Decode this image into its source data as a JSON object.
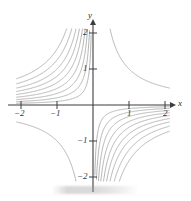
{
  "figure": {
    "title": "",
    "background_color": "#ffffff",
    "width": 191,
    "height": 201
  },
  "axes": {
    "x_axis_label": "x",
    "y_axis_label": "y",
    "axis_color": "#3d3d3d",
    "arrow_x_name": "x-axis-arrow",
    "arrow_y_name": "y-axis-arrow",
    "x_ticks": [
      {
        "value": -2,
        "label": "−2",
        "px": 21
      },
      {
        "value": -1,
        "label": "−1",
        "px": 57
      },
      {
        "value": 1,
        "label": "1",
        "px": 129
      },
      {
        "value": 2,
        "label": "2",
        "px": 165
      }
    ],
    "y_ticks": [
      {
        "value": 2,
        "label": "2",
        "px": 33
      },
      {
        "value": 1,
        "label": "1",
        "px": 69
      },
      {
        "value": -1,
        "label": "−1",
        "px": 141
      },
      {
        "value": -2,
        "label": "−2",
        "px": 177
      }
    ],
    "origin": {
      "x_px": 93,
      "y_px": 105
    }
  },
  "chart_data": {
    "type": "line",
    "title": "",
    "subtitle": "",
    "xlabel": "x",
    "ylabel": "y",
    "xlim": [
      -2.15,
      2.15
    ],
    "ylim": [
      -2.15,
      2.15
    ],
    "xticks": [
      -2,
      -1,
      1,
      2
    ],
    "yticks": [
      -2,
      -1,
      1,
      2
    ],
    "grid": false,
    "legend": null,
    "legend_position": "none",
    "annotations": [],
    "curve_color": "#9a9a9a",
    "series": [
      {
        "name": "xy = -0.10",
        "c": -0.1,
        "quadrants": [
          "upper-left",
          "lower-right"
        ]
      },
      {
        "name": "xy = -0.20",
        "c": -0.2,
        "quadrants": [
          "upper-left",
          "lower-right"
        ]
      },
      {
        "name": "xy = -0.32",
        "c": -0.32,
        "quadrants": [
          "upper-left",
          "lower-right"
        ]
      },
      {
        "name": "xy = -0.46",
        "c": -0.46,
        "quadrants": [
          "upper-left",
          "lower-right"
        ]
      },
      {
        "name": "xy = -0.62",
        "c": -0.62,
        "quadrants": [
          "upper-left",
          "lower-right"
        ]
      },
      {
        "name": "xy = -0.80",
        "c": -0.8,
        "quadrants": [
          "upper-left",
          "lower-right"
        ]
      },
      {
        "name": "xy = -1.00",
        "c": -1.0,
        "quadrants": [
          "upper-left",
          "lower-right"
        ]
      },
      {
        "name": "xy = -1.25",
        "c": -1.25,
        "quadrants": [
          "upper-left",
          "lower-right"
        ]
      },
      {
        "name": "xy = -1.55",
        "c": -1.55,
        "quadrants": [
          "upper-left",
          "lower-right"
        ]
      },
      {
        "name": "xy = 1.00",
        "c": 1.0,
        "quadrants": [
          "upper-right",
          "lower-left"
        ]
      }
    ]
  }
}
